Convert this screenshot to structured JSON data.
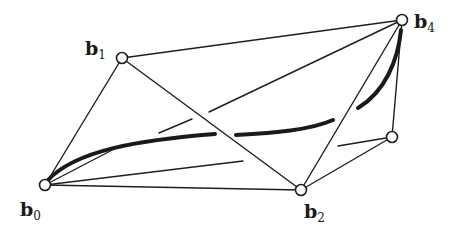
{
  "diagram": {
    "type": "bezier-control-polygon-3d",
    "colors": {
      "line": "#1e1e1e",
      "background": "#ffffff",
      "node_fill": "#ffffff"
    },
    "nodes": [
      {
        "id": "b0",
        "x": 45,
        "y": 185,
        "label": "b",
        "sub": "0",
        "lx": 20,
        "ly": 216
      },
      {
        "id": "b1",
        "x": 122,
        "y": 58,
        "label": "b",
        "sub": "1",
        "lx": 85,
        "ly": 55
      },
      {
        "id": "b2",
        "x": 301,
        "y": 190,
        "label": "b",
        "sub": "2",
        "lx": 304,
        "ly": 218
      },
      {
        "id": "b3",
        "x": 392,
        "y": 137,
        "label": "",
        "sub": "",
        "lx": 0,
        "ly": 0
      },
      {
        "id": "b4",
        "x": 402,
        "y": 20,
        "label": "b",
        "sub": "4",
        "lx": 414,
        "ly": 28
      }
    ],
    "labels": {
      "b0": {
        "main": "b",
        "sub": "0"
      },
      "b1": {
        "main": "b",
        "sub": "1"
      },
      "b2": {
        "main": "b",
        "sub": "2"
      },
      "b4": {
        "main": "b",
        "sub": "4"
      }
    },
    "edges": [
      {
        "from": "b0",
        "to": "b1"
      },
      {
        "from": "b1",
        "to": "b4"
      },
      {
        "from": "b1",
        "to": "b2"
      },
      {
        "from": "b0",
        "to": "b2"
      },
      {
        "from": "b2",
        "to": "b4"
      },
      {
        "from": "b2",
        "to": "b3"
      },
      {
        "from": "b3",
        "to": "b4"
      }
    ],
    "hidden_edges": [
      {
        "from": "b0",
        "to": "b4",
        "segments": [
          [
            45,
            185,
            118,
            147
          ],
          [
            159,
            133,
            192,
            119
          ],
          [
            209,
            112,
            402,
            20
          ]
        ]
      },
      {
        "from": "b0",
        "to": "b3",
        "segments": [
          [
            45,
            185,
            243,
            161
          ],
          [
            338,
            146,
            392,
            137
          ]
        ]
      }
    ],
    "curve": {
      "description": "Bezier curve (thick) from b0 to b4, drawn with gaps where it passes behind edges",
      "segments": [
        "M 47 181 C 75 150, 140 140, 215 134",
        "M 236 135 C 275 133, 310 130, 333 120",
        "M 358 108 C 385 92, 398 60, 401 30"
      ]
    }
  }
}
